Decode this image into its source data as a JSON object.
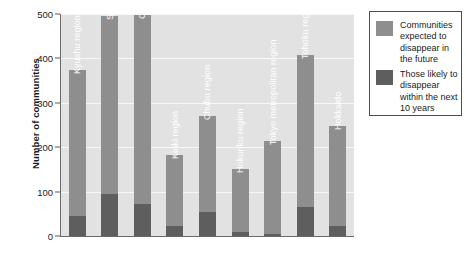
{
  "chart_data": {
    "type": "bar",
    "title": "",
    "subtitle": "",
    "xlabel": "",
    "ylabel": "Number of communities",
    "ylim": [
      0,
      500
    ],
    "yticks": [
      0,
      100,
      200,
      300,
      400,
      500
    ],
    "grid": true,
    "stacked": true,
    "legend_position": "right",
    "categories": [
      "Kyushu region",
      "Shikoku region",
      "Chugoku region",
      "Kinki region",
      "Chubu region",
      "Hokuriku region",
      "Tokyo metropolitan region",
      "Tohoku region",
      "Hokkaido"
    ],
    "series": [
      {
        "name": "Communities expected to disappear in the future",
        "color": "#8e8e8e",
        "values": [
          375,
          495,
          497,
          182,
          270,
          150,
          215,
          408,
          247
        ]
      },
      {
        "name": "Those likely to disappear within the next 10 years",
        "color": "#5e5e5e",
        "values": [
          45,
          95,
          72,
          22,
          55,
          8,
          5,
          65,
          22
        ]
      }
    ]
  },
  "axis": {
    "y_title": "Number of communities",
    "y_tick_labels": [
      "500",
      "400",
      "300",
      "200",
      "100",
      "0"
    ]
  },
  "legend": {
    "entries": [
      {
        "label": "Communities expected to disappear in the future",
        "color": "#8e8e8e"
      },
      {
        "label": "Those likely to disappear within the next 10 years",
        "color": "#5e5e5e"
      }
    ]
  },
  "colors": {
    "plot_background": "#e2e2e2",
    "gridline": "#f7f7f7",
    "axis_line": "#6a6a6a",
    "light_bar": "#8e8e8e",
    "dark_bar": "#5e5e5e",
    "text": "#1b1b1b",
    "bar_label_text": "#ffffff",
    "page_background": "#ffffff"
  }
}
